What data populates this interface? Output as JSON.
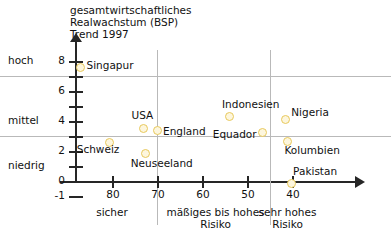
{
  "chart_data": {
    "type": "scatter",
    "title": "gesamtwirtschaftliches\nRealwachstum (BSP)\nTrend 1997",
    "ylabel": "",
    "xlabel": "",
    "xlim": [
      88,
      36
    ],
    "ylim": [
      -1,
      8.6
    ],
    "x_axis_inverted": true,
    "grid": true,
    "legend": "none",
    "y_ticks": [
      {
        "value": 8,
        "label": "8"
      },
      {
        "value": 7,
        "label": ""
      },
      {
        "value": 6,
        "label": "6"
      },
      {
        "value": 5,
        "label": ""
      },
      {
        "value": 4,
        "label": "4"
      },
      {
        "value": 3,
        "label": ""
      },
      {
        "value": 2,
        "label": "2"
      },
      {
        "value": 1,
        "label": ""
      },
      {
        "value": 0,
        "label": "0"
      },
      {
        "value": -1,
        "label": "-1"
      }
    ],
    "y_categories": [
      {
        "label": "hoch",
        "value": 8
      },
      {
        "label": "mittel",
        "value": 4
      },
      {
        "label": "niedrig",
        "value": 1
      }
    ],
    "x_ticks": [
      {
        "value": 80,
        "label": "80"
      },
      {
        "value": 70,
        "label": "70"
      },
      {
        "value": 60,
        "label": "60"
      },
      {
        "value": 50,
        "label": "50"
      },
      {
        "value": 40,
        "label": "40"
      }
    ],
    "x_categories": [
      {
        "label": "sicher",
        "center": 80
      },
      {
        "label": "mäßiges bis hohes\nRisiko",
        "center": 57
      },
      {
        "label": "sehr hohes\nRisiko",
        "center": 41
      }
    ],
    "gridlines_h": [
      7,
      3
    ],
    "gridlines_v": [
      70,
      45
    ],
    "points": [
      {
        "name": "Singapur",
        "x": 87,
        "y": 7.6,
        "label_dx": 6,
        "label_dy": -2
      },
      {
        "name": "Schweiz",
        "x": 80.5,
        "y": 2.6,
        "label_dx": -33,
        "label_dy": 7
      },
      {
        "name": "USA",
        "x": 73,
        "y": 3.5,
        "label_dx": -12,
        "label_dy": -14
      },
      {
        "name": "England",
        "x": 70,
        "y": 3.35,
        "label_dx": 6,
        "label_dy": 0
      },
      {
        "name": "Neuseeland",
        "x": 72.5,
        "y": 1.85,
        "label_dx": -15,
        "label_dy": 10
      },
      {
        "name": "Indonesien",
        "x": 54,
        "y": 4.3,
        "label_dx": -7,
        "label_dy": -13
      },
      {
        "name": "Equador",
        "x": 46.5,
        "y": 3.25,
        "label_dx": -50,
        "label_dy": 2
      },
      {
        "name": "Nigeria",
        "x": 41.5,
        "y": 4.1,
        "label_dx": 6,
        "label_dy": -8
      },
      {
        "name": "Kolumbien",
        "x": 41,
        "y": 2.65,
        "label_dx": -3,
        "label_dy": 9
      },
      {
        "name": "Pakistan",
        "x": 40.2,
        "y": -0.15,
        "label_dx": 2,
        "label_dy": -12
      }
    ]
  }
}
